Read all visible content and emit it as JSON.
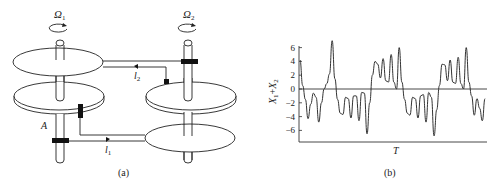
{
  "panel_a": {
    "caption": "(a)",
    "omega1": {
      "base": "Ω",
      "sub": "1"
    },
    "omega2": {
      "base": "Ω",
      "sub": "2"
    },
    "point_label": "A",
    "l1": {
      "base": "l",
      "sub": "1"
    },
    "l2": {
      "base": "l",
      "sub": "2"
    }
  },
  "panel_b": {
    "caption": "(b)",
    "ylabel": {
      "a": "X",
      "a_sub": "1",
      "plus": "+",
      "b": "X",
      "b_sub": "2"
    },
    "xlabel": "T"
  },
  "chart_data": {
    "type": "line",
    "title": "",
    "xlabel": "T",
    "ylabel": "X1+X2",
    "ylim": [
      -7.5,
      7
    ],
    "yticks": [
      6,
      4,
      2,
      0,
      -2,
      -4,
      -6
    ],
    "grid": false,
    "zero_line": true,
    "series": [
      {
        "name": "X1+X2",
        "x": [
          0,
          0.4,
          0.8,
          1.2,
          1.6,
          2.0,
          2.4,
          2.8,
          3.2,
          3.6,
          4.0,
          4.4,
          4.8,
          5.2,
          5.6,
          6.0,
          6.4,
          6.8,
          7.2,
          7.6,
          8.0,
          8.4,
          8.8,
          9.2,
          9.6,
          10.0,
          10.4,
          10.8,
          11.2,
          11.6,
          12.0,
          12.4,
          12.8,
          13.2,
          13.6,
          14.0,
          14.4,
          14.8,
          15.2,
          15.6,
          16.0,
          16.4,
          16.8,
          17.2,
          17.6,
          18.0,
          18.4,
          18.8,
          19.2,
          19.6,
          20.0,
          20.4,
          20.8,
          21.2,
          21.6,
          22.0,
          22.4,
          22.8,
          23.2,
          23.6,
          24.0,
          24.4,
          24.8,
          25.2,
          25.6,
          26.0,
          26.4,
          26.8,
          27.2,
          27.6,
          28.0,
          28.4,
          28.8,
          29.2,
          29.6,
          30.0,
          30.4,
          30.8,
          31.2,
          31.6,
          32.0,
          32.4,
          32.8,
          33.2,
          33.6,
          34.0,
          34.4,
          34.8,
          35.2,
          35.6,
          36.0,
          36.4,
          36.8,
          37.2,
          37.6,
          38.0,
          38.4,
          38.8,
          39.2,
          39.6,
          40.0,
          40.4,
          40.8,
          41.2,
          41.6,
          42.0,
          42.4,
          42.8,
          43.2,
          43.6,
          44.0,
          44.4,
          44.8,
          45.2,
          45.6,
          46.0,
          46.4,
          46.8,
          47.2,
          47.6,
          48.0,
          48.4,
          48.8,
          49.2,
          49.6,
          50.0,
          50.4,
          50.8,
          51.2,
          51.6,
          52.0,
          52.4,
          52.8,
          53.2,
          53.6,
          54.0,
          54.4,
          54.8,
          55.2,
          55.6,
          56.0
        ],
        "values": [
          4.2,
          0.5,
          -1.5,
          -4.3,
          -2.2,
          -0.6,
          -1.2,
          -4.8,
          -2.0,
          0,
          0.8,
          2.2,
          7.0,
          1.5,
          -1.5,
          -3.5,
          -3.7,
          -1.2,
          -1.4,
          -4.2,
          -1.0,
          -1.0,
          -4.6,
          -0.5,
          -0.6,
          -6.5,
          -2.0,
          2.0,
          4.0,
          3.6,
          1.6,
          4.4,
          1.2,
          1.0,
          5.0,
          1.0,
          0,
          6.0,
          1.0,
          -1.5,
          -3.5,
          -3.8,
          -1.2,
          -1.4,
          -4.2,
          -1.0,
          -0.8,
          -4.8,
          -0.5,
          -1.2,
          -6.8,
          -3.0,
          0.5,
          3.6,
          3.5,
          1.2,
          4.2,
          1.0,
          0.8,
          4.6,
          0.8,
          0,
          6.0,
          1.0,
          -1.0,
          -3.8,
          -1.4,
          -2.8,
          -4.6,
          -1.4,
          0,
          0,
          0,
          0,
          0,
          0,
          0,
          0,
          0,
          0,
          0,
          0,
          0,
          0,
          0,
          0,
          0,
          0,
          0,
          0,
          0,
          0,
          0,
          0,
          0,
          0,
          0,
          0,
          0,
          0,
          0,
          0,
          0,
          0,
          0,
          0,
          0,
          0,
          0,
          0,
          0,
          0,
          0,
          0,
          0,
          0,
          0,
          0,
          0,
          0,
          0,
          0,
          0,
          0,
          0,
          0,
          0,
          0,
          0,
          0,
          0,
          0,
          0,
          0,
          0,
          0,
          0,
          0,
          0,
          0,
          0
        ]
      }
    ]
  }
}
